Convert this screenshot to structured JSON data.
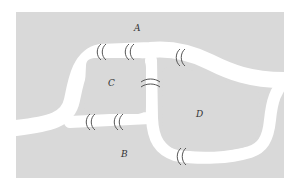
{
  "diagram": {
    "colors": {
      "land": "#d9d9d9",
      "river": "#ffffff",
      "bridge_stroke": "#555555",
      "label": "#333333"
    },
    "regions": [
      {
        "id": "A",
        "label": "A"
      },
      {
        "id": "B",
        "label": "B"
      },
      {
        "id": "C",
        "label": "C"
      },
      {
        "id": "D",
        "label": "D"
      }
    ],
    "bridges": [
      {
        "name": "bridge-a-c-left",
        "connects": [
          "A",
          "C"
        ]
      },
      {
        "name": "bridge-a-c-right",
        "connects": [
          "A",
          "C"
        ]
      },
      {
        "name": "bridge-b-c-left",
        "connects": [
          "B",
          "C"
        ]
      },
      {
        "name": "bridge-b-c-right",
        "connects": [
          "B",
          "C"
        ]
      },
      {
        "name": "bridge-c-d",
        "connects": [
          "C",
          "D"
        ]
      },
      {
        "name": "bridge-a-d",
        "connects": [
          "A",
          "D"
        ]
      },
      {
        "name": "bridge-b-d",
        "connects": [
          "B",
          "D"
        ]
      }
    ]
  }
}
